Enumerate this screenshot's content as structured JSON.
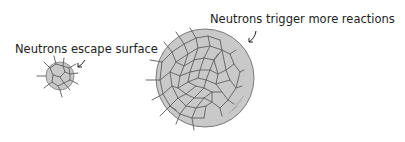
{
  "labels": {
    "small": "Neutrons escape surface",
    "large": "Neutrons trigger more reactions"
  },
  "colors": {
    "sphere_fill": "#c9c9c9",
    "sphere_stroke": "#6e6e6e",
    "line": "#6a6a6a",
    "text": "#222222"
  }
}
